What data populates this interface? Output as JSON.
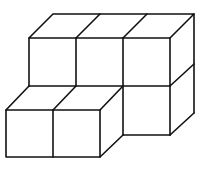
{
  "diagram": {
    "cube_count": 5,
    "stroke_color": "#111111",
    "background_color": "#ffffff"
  }
}
